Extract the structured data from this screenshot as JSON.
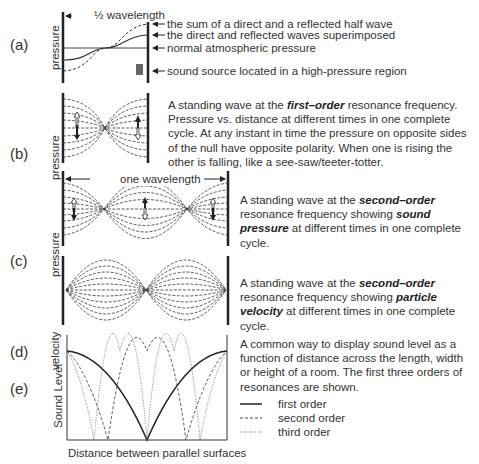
{
  "panels": {
    "a": {
      "label": "(a)",
      "axis_label": "pressure",
      "dimension_label": "½ wavelength",
      "annotations": [
        "the sum of a direct and a reflected half wave",
        "the direct and reflected waves superimposed",
        "normal atmospheric pressure",
        "sound source located in a high-pressure region"
      ]
    },
    "b": {
      "label": "(b)",
      "axis_label": "pressure",
      "desc_pre": "A standing wave at the ",
      "desc_bold": "first–order",
      "desc_post": " resonance frequency. Pressure vs. distance at different times in one complete cycle. At any instant in time the pressure on opposite sides of the null have opposite polarity. When one is rising the other is falling, like a see-saw/teeter-totter."
    },
    "c": {
      "label": "(c)",
      "axis_label": "pressure",
      "dimension_label": "one wavelength",
      "desc_pre": "A standing wave at the ",
      "desc_bold": "second–order",
      "desc_mid": " resonance frequency showing ",
      "desc_bold2": "sound pressure",
      "desc_post": " at different times in one complete cycle."
    },
    "d": {
      "label": "(d)",
      "axis_label": "velocity",
      "desc_pre": "A standing wave at the ",
      "desc_bold": "second–order",
      "desc_mid": " resonance frequency showing ",
      "desc_bold2": "particle velocity",
      "desc_post": " at different times in one complete cycle."
    },
    "e": {
      "label": "(e)",
      "axis_label": "Sound Level",
      "x_label": "Distance between parallel surfaces",
      "desc": "A common way to display sound level as a function of distance across the length, width or height of a room. The first three orders of resonances are shown.",
      "legend": [
        {
          "label": "first order",
          "style": "solid"
        },
        {
          "label": "second order",
          "style": "dashed"
        },
        {
          "label": "third order",
          "style": "dotted"
        }
      ]
    }
  },
  "colors": {
    "text": "#333333",
    "line": "#222222",
    "source_box": "#666666",
    "background": "#ffffff"
  }
}
